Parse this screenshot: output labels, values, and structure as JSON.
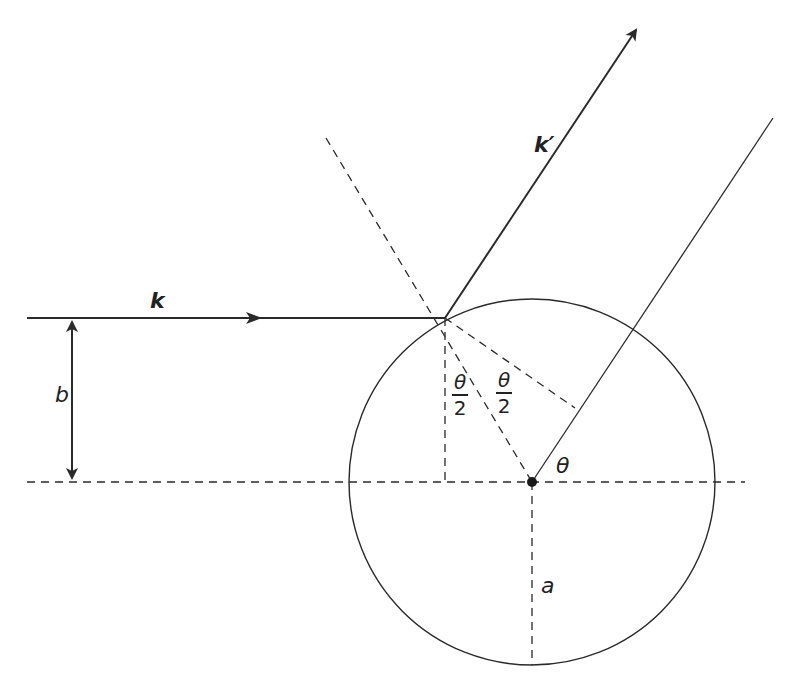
{
  "diagram": {
    "title": "",
    "labels": {
      "incident_vector": "k",
      "scattered_vector": "k′",
      "impact_parameter": "b",
      "radius": "a",
      "scattering_angle": "θ",
      "half_angle_1_num": "θ",
      "half_angle_1_den": "2",
      "half_angle_2_num": "θ",
      "half_angle_2_den": "2"
    },
    "colors": {
      "line": "#2a2a2a",
      "background": "#ffffff"
    },
    "geometry": {
      "circle_center": [
        532,
        482
      ],
      "circle_radius": 183,
      "impact_point": [
        445,
        318
      ],
      "incident_line": [
        [
          27,
          318
        ],
        [
          445,
          318
        ]
      ],
      "scattered_vector": [
        [
          445,
          318
        ],
        [
          638,
          27
        ]
      ],
      "parallel_line": [
        [
          532,
          482
        ],
        [
          773,
          118
        ]
      ],
      "normal_dashed": [
        [
          326,
          138
        ],
        [
          532,
          482
        ]
      ],
      "axis_dashed": [
        [
          27,
          482
        ],
        [
          745,
          482
        ]
      ]
    }
  }
}
